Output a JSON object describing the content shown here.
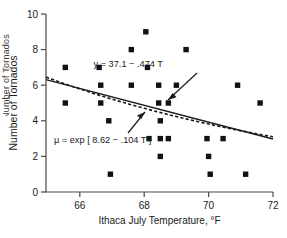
{
  "figure": {
    "background": "#ffffff",
    "foreground": "#1a1a1a",
    "axis_color": "#4a4a4a",
    "marker_color": "#111111",
    "clipped_neighbor_label": "Number of Tornados"
  },
  "chart_data": {
    "type": "scatter",
    "title": "",
    "xlabel": "Ithaca July Temperature, °F",
    "ylabel": "Number of Tornados",
    "xlim": [
      64.95,
      72.0
    ],
    "ylim": [
      0,
      10
    ],
    "xticks": [
      66,
      68,
      70,
      72
    ],
    "xtick_labels": [
      "66",
      "68",
      "70",
      "72"
    ],
    "yticks": [
      0,
      2,
      4,
      6,
      8,
      10
    ],
    "ytick_labels": [
      "0",
      "2",
      "4",
      "6",
      "8",
      "10"
    ],
    "grid": false,
    "legend": "none",
    "marker": "square",
    "points": [
      {
        "x": 65.55,
        "y": 7
      },
      {
        "x": 65.55,
        "y": 5
      },
      {
        "x": 66.6,
        "y": 7
      },
      {
        "x": 66.65,
        "y": 6
      },
      {
        "x": 66.65,
        "y": 5
      },
      {
        "x": 66.9,
        "y": 4
      },
      {
        "x": 66.95,
        "y": 1
      },
      {
        "x": 67.6,
        "y": 8
      },
      {
        "x": 67.6,
        "y": 6
      },
      {
        "x": 68.05,
        "y": 9
      },
      {
        "x": 68.1,
        "y": 7
      },
      {
        "x": 68.15,
        "y": 3
      },
      {
        "x": 68.45,
        "y": 6
      },
      {
        "x": 68.45,
        "y": 5
      },
      {
        "x": 68.5,
        "y": 4
      },
      {
        "x": 68.5,
        "y": 3
      },
      {
        "x": 68.5,
        "y": 2
      },
      {
        "x": 68.75,
        "y": 5
      },
      {
        "x": 68.75,
        "y": 3
      },
      {
        "x": 69.0,
        "y": 6
      },
      {
        "x": 69.3,
        "y": 8
      },
      {
        "x": 69.95,
        "y": 3
      },
      {
        "x": 70.0,
        "y": 2
      },
      {
        "x": 70.05,
        "y": 1
      },
      {
        "x": 70.45,
        "y": 3
      },
      {
        "x": 70.9,
        "y": 6
      },
      {
        "x": 71.15,
        "y": 1
      },
      {
        "x": 71.6,
        "y": 5
      }
    ],
    "series": [
      {
        "name": "linear-fit",
        "style": "solid",
        "equation": "y = 37.1 − .474 T",
        "intercept": 37.1,
        "slope": -0.474,
        "x_start": 64.95,
        "x_end": 72.0
      },
      {
        "name": "poisson-fit",
        "style": "dashed",
        "equation": "µ = exp [ 8.62 − .104 T ]",
        "log_intercept": 8.62,
        "log_slope": -0.104,
        "x_start": 64.95,
        "x_end": 72.0
      }
    ],
    "annotations": [
      {
        "name": "linear-equation-annotation",
        "text": "y = 37.1 − .474 T",
        "label_x": 72.2,
        "label_y": 155.0,
        "points_to": "linear-fit"
      },
      {
        "name": "poisson-equation-annotation",
        "text": "µ = exp [ 8.62 − .104 T ]",
        "label_x": 32.0,
        "label_y": 93.0,
        "points_to": "poisson-fit"
      }
    ]
  }
}
